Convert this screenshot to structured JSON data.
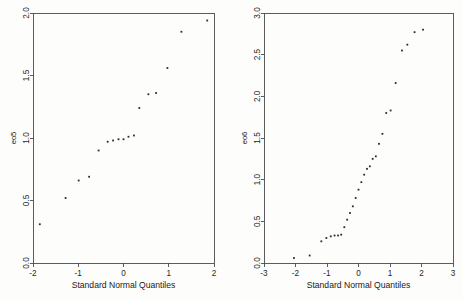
{
  "figure": {
    "background_color": "#fdfdfc",
    "point_color": "#2b2b2b",
    "axis_color": "#4a4a4a"
  },
  "chart_data": [
    {
      "type": "scatter",
      "panel": "left",
      "title": "",
      "xlabel": "Standard Normal Quantiles",
      "ylabel": "eo5",
      "xlim": [
        -2,
        2
      ],
      "ylim": [
        0.0,
        2.0
      ],
      "xticks": [
        -2,
        -1,
        0,
        1,
        2
      ],
      "xticklabels": [
        "-2",
        "-1",
        "0",
        "1",
        "2"
      ],
      "yticks": [
        0.0,
        0.5,
        1.0,
        1.5,
        2.0
      ],
      "yticklabels": [
        "0.0",
        "0.5",
        "1.0",
        "1.5",
        "2.0"
      ],
      "grid": false,
      "legend": "none",
      "marker": "point",
      "x": [
        -1.85,
        -1.28,
        -0.99,
        -0.76,
        -0.55,
        -0.35,
        -0.23,
        -0.11,
        0.0,
        0.11,
        0.23,
        0.35,
        0.55,
        0.72,
        0.97,
        1.28,
        1.85
      ],
      "y": [
        0.31,
        0.52,
        0.66,
        0.69,
        0.9,
        0.97,
        0.98,
        0.99,
        0.99,
        1.01,
        1.02,
        1.24,
        1.35,
        1.36,
        1.56,
        1.85,
        1.94
      ]
    },
    {
      "type": "scatter",
      "panel": "right",
      "title": "",
      "xlabel": "Standard Normal Quantiles",
      "ylabel": "eo6",
      "xlim": [
        -3,
        3
      ],
      "ylim": [
        0.0,
        3.0
      ],
      "xticks": [
        -3,
        -2,
        -1,
        0,
        1,
        2,
        3
      ],
      "xticklabels": [
        "-3",
        "-2",
        "-1",
        "0",
        "1",
        "2",
        "3"
      ],
      "yticks": [
        0.0,
        0.5,
        1.0,
        1.5,
        2.0,
        2.5,
        3.0
      ],
      "yticklabels": [
        "0.0",
        "0.5",
        "1.0",
        "1.5",
        "2.0",
        "2.5",
        "3.0"
      ],
      "grid": false,
      "legend": "none",
      "marker": "point",
      "x": [
        -2.05,
        -1.55,
        -1.18,
        -1.02,
        -0.88,
        -0.76,
        -0.65,
        -0.55,
        -0.45,
        -0.36,
        -0.27,
        -0.18,
        -0.09,
        0.0,
        0.09,
        0.18,
        0.27,
        0.36,
        0.45,
        0.55,
        0.65,
        0.76,
        0.88,
        1.02,
        1.18,
        1.38,
        1.55,
        1.78,
        2.05
      ],
      "y": [
        0.06,
        0.09,
        0.26,
        0.3,
        0.32,
        0.33,
        0.33,
        0.34,
        0.43,
        0.52,
        0.6,
        0.68,
        0.78,
        0.88,
        0.97,
        1.06,
        1.13,
        1.16,
        1.25,
        1.28,
        1.43,
        1.55,
        1.8,
        1.83,
        2.16,
        2.55,
        2.62,
        2.77,
        2.8
      ]
    }
  ]
}
